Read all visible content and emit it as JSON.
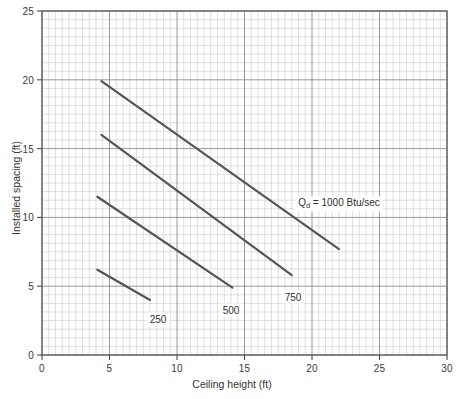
{
  "chart_data": {
    "type": "line",
    "title": "",
    "xlabel": "Ceiling height (ft)",
    "ylabel": "Installed spacing (ft)",
    "xlim": [
      0,
      30
    ],
    "ylim": [
      0,
      25
    ],
    "xticks": [
      "0",
      "5",
      "10",
      "15",
      "20",
      "25",
      "30"
    ],
    "yticks": [
      "0",
      "5",
      "10",
      "15",
      "20",
      "25"
    ],
    "xtick_values": [
      0,
      5,
      10,
      15,
      20,
      25,
      30
    ],
    "ytick_values": [
      0,
      5,
      10,
      15,
      20,
      25
    ],
    "grid": "major and minor grid, minor spacing 0.5 units",
    "legend_position": "inline labels at curve ends",
    "series": [
      {
        "name": "250",
        "label": "250",
        "unit": "Btu/sec",
        "points": [
          [
            4.1,
            6.2
          ],
          [
            8.0,
            4.0
          ]
        ],
        "color": "#555555"
      },
      {
        "name": "500",
        "label": "500",
        "unit": "Btu/sec",
        "points": [
          [
            4.1,
            11.5
          ],
          [
            14.1,
            4.9
          ]
        ],
        "color": "#555555"
      },
      {
        "name": "750",
        "label": "750",
        "unit": "Btu/sec",
        "points": [
          [
            4.4,
            16.0
          ],
          [
            18.5,
            5.8
          ]
        ],
        "color": "#555555"
      },
      {
        "name": "1000",
        "label": "Q_d = 1000 Btu/sec",
        "unit": "Btu/sec",
        "points": [
          [
            4.4,
            19.9
          ],
          [
            22.0,
            7.7
          ]
        ],
        "color": "#555555"
      }
    ],
    "annotations": [
      {
        "text_prefix": "Q",
        "text_sub": "d",
        "text_suffix": " = 1000 Btu/sec",
        "x": 22.0,
        "y": 11.0
      },
      {
        "text": "750",
        "x": 18.6,
        "y": 4.2
      },
      {
        "text": "500",
        "x": 14.0,
        "y": 3.3
      },
      {
        "text": "250",
        "x": 8.6,
        "y": 2.6
      }
    ],
    "colors": {
      "curve": "#555555",
      "grid_minor": "#c9c9c9",
      "grid_major": "#8d8d8d",
      "axis": "#4a4a4a",
      "background": "#ffffff"
    }
  },
  "axes": {
    "x_title": "Ceiling height (ft)",
    "y_title": "Installed spacing (ft)"
  },
  "annotation_labels": {
    "qd_prefix": "Q",
    "qd_sub": "d",
    "qd_suffix": " = 1000 Btu/sec",
    "c750": "750",
    "c500": "500",
    "c250": "250"
  }
}
